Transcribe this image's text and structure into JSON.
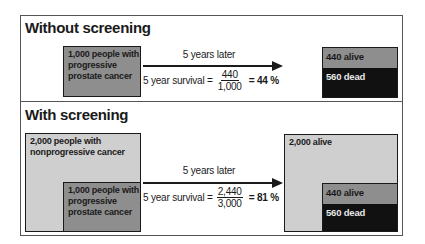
{
  "panels": [
    {
      "title": "Without screening",
      "start_box": {
        "label": "1,000 people with progressive prostate cancer"
      },
      "arrow_caption": "5 years later",
      "formula": {
        "prefix": "5 year survival =",
        "numerator": "440",
        "denominator": "1,000",
        "result": "= 44 %"
      },
      "result_box": {
        "alive_label": "440 alive",
        "dead_label": "560 dead"
      }
    },
    {
      "title": "With screening",
      "outer_box": {
        "label": "2,000 people with nonprogressive cancer"
      },
      "start_box": {
        "label": "1,000 people with progressive prostate cancer"
      },
      "arrow_caption": "5 years later",
      "formula": {
        "prefix": "5 year survival =",
        "numerator": "2,440",
        "denominator": "3,000",
        "result": "= 81 %"
      },
      "result_outer_box": {
        "label": "2,000 alive"
      },
      "result_box": {
        "alive_label": "440 alive",
        "dead_label": "560 dead"
      }
    }
  ],
  "colors": {
    "progressive": "#8e8e8e",
    "nonprogressive": "#cfcfcf",
    "dead": "#111111",
    "border": "#1a1a1a"
  }
}
